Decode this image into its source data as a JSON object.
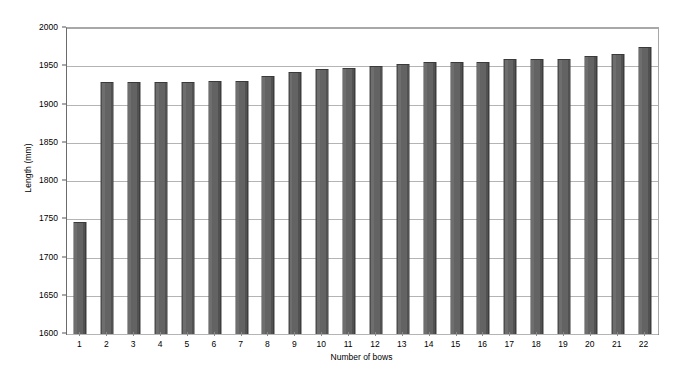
{
  "chart_data": {
    "type": "bar",
    "title": "",
    "xlabel": "Number of bows",
    "ylabel": "Length (mm)",
    "categories": [
      "1",
      "2",
      "3",
      "4",
      "5",
      "6",
      "7",
      "8",
      "9",
      "10",
      "11",
      "12",
      "13",
      "14",
      "15",
      "16",
      "17",
      "18",
      "19",
      "20",
      "21",
      "22"
    ],
    "values": [
      1746,
      1929,
      1929,
      1930,
      1930,
      1931,
      1931,
      1937,
      1942,
      1947,
      1948,
      1950,
      1953,
      1956,
      1956,
      1956,
      1959,
      1959,
      1959,
      1963,
      1966,
      1975
    ],
    "ylim": [
      1600,
      2000
    ],
    "ytick_step": 50,
    "yticks": [
      1600,
      1650,
      1700,
      1750,
      1800,
      1850,
      1900,
      1950,
      2000
    ],
    "ytick_labels": [
      "1600",
      "1650",
      "1700",
      "1750",
      "1800",
      "1850",
      "1900",
      "1950",
      "2000"
    ],
    "grid": true,
    "grid_axis": "y",
    "legend": false,
    "legend_position": "none",
    "bar_color": "#636363",
    "bar_edge_color": "#3a3a3a",
    "plot_background": "#ffffff",
    "gridline_color": "#b4b4b4",
    "axis_color": "#6b6b6b"
  }
}
